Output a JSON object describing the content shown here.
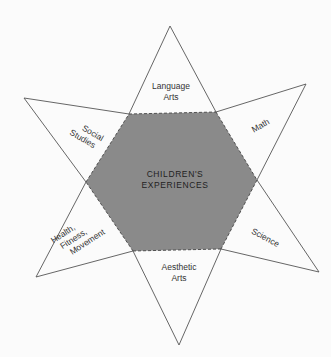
{
  "diagram": {
    "type": "six-pointed-star",
    "colors": {
      "background": "#fbfbfb",
      "hexagon_fill": "#8a8a8a",
      "stroke": "#555555"
    },
    "center": {
      "line1": "CHILDREN'S",
      "line2": "EXPERIENCES"
    },
    "points": [
      {
        "position": "top",
        "lines": [
          "Language",
          "Arts"
        ]
      },
      {
        "position": "upper-right",
        "lines": [
          "Math"
        ]
      },
      {
        "position": "lower-right",
        "lines": [
          "Science"
        ]
      },
      {
        "position": "bottom",
        "lines": [
          "Aesthetic",
          "Arts"
        ]
      },
      {
        "position": "lower-left",
        "lines": [
          "Health,",
          "Fitness,",
          "Movement"
        ]
      },
      {
        "position": "upper-left",
        "lines": [
          "Social",
          "Studies"
        ]
      }
    ]
  }
}
